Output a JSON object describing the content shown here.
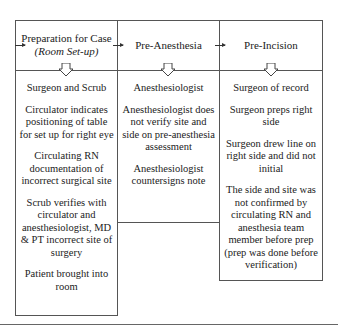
{
  "columns": [
    {
      "title": "Preparation for Case",
      "subtitle": "(Room Set-up)",
      "items": [
        "Surgeon and Scrub",
        "Circulator indicates positioning of table for set up for right eye",
        "Circulating RN documentation of incorrect surgical site",
        "Scrub verifies with circulator and anesthesiologist, MD & PT incorrect site of surgery",
        "Patient brought into room"
      ]
    },
    {
      "title": "Pre-Anesthesia",
      "items": [
        "Anesthesiologist",
        "Anesthesiologist does not verify site and side on pre-anesthesia assessment",
        "Anesthesiologist countersigns note"
      ]
    },
    {
      "title": "Pre-Incision",
      "items": [
        "Surgeon of record",
        "Surgeon preps right side",
        "Surgeon drew line on right side and did not initial",
        "The side and site was not confirmed by circulating RN and anesthesia team member before prep (prep was done before verification)"
      ]
    }
  ]
}
